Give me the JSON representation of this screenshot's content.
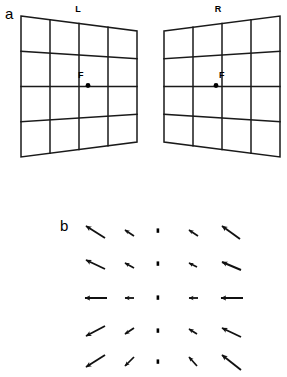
{
  "figure": {
    "panels": [
      {
        "id": "a",
        "letter": "a",
        "description": "Two perspective grid planes, one for each eye, with a fixation point F"
      },
      {
        "id": "b",
        "letter": "b",
        "description": "Vector field of retinal motion arrows arranged in a 5 by 5 array about a dotted vertical midline"
      }
    ],
    "stroke_color": "#1a1a1a",
    "background_color": "#ffffff"
  },
  "panel_a": {
    "letter": "a",
    "eyes": [
      {
        "id": "left",
        "label": "L",
        "label_name": "left-eye",
        "fixation_label": "F",
        "near_edge": "left",
        "rows": 4,
        "columns": 4,
        "outline": [
          [
            21,
            16
          ],
          [
            137,
            31
          ],
          [
            137,
            142
          ],
          [
            21,
            157
          ]
        ]
      },
      {
        "id": "right",
        "label": "R",
        "label_name": "right-eye",
        "fixation_label": "F",
        "near_edge": "right",
        "rows": 4,
        "columns": 4,
        "outline": [
          [
            164,
            31
          ],
          [
            280,
            16
          ],
          [
            280,
            157
          ],
          [
            164,
            142
          ]
        ]
      }
    ],
    "fixation": {
      "label": "F",
      "left_point": [
        88,
        85
      ],
      "right_point": [
        216,
        85
      ],
      "dot_radius": 2.4
    }
  },
  "panel_b": {
    "letter": "b",
    "midline": {
      "name": "dotted-midline",
      "x": 158,
      "y_top": 228,
      "y_bottom": 362,
      "dot_count": 5,
      "style": "dotted"
    },
    "vector_field": {
      "rows": 5,
      "columns": 5,
      "midline_column_index": 2,
      "column_x": [
        94,
        128,
        158,
        192,
        226
      ],
      "row_y": [
        231,
        264,
        298,
        331,
        362
      ],
      "arrows": [
        {
          "row": 0,
          "col": 0,
          "x": 94,
          "y": 231,
          "dx": -19,
          "dy": -12,
          "length": 22.5,
          "angle_deg": 212,
          "size": "long"
        },
        {
          "row": 0,
          "col": 1,
          "x": 128,
          "y": 231,
          "dx": -9,
          "dy": -6,
          "length": 10.8,
          "angle_deg": 214,
          "size": "short"
        },
        {
          "row": 0,
          "col": 3,
          "x": 192,
          "y": 231,
          "dx": -8,
          "dy": -6,
          "length": 10.0,
          "angle_deg": 217,
          "size": "short"
        },
        {
          "row": 0,
          "col": 4,
          "x": 226,
          "y": 231,
          "dx": -18,
          "dy": -13,
          "length": 22.2,
          "angle_deg": 216,
          "size": "long"
        },
        {
          "row": 1,
          "col": 0,
          "x": 94,
          "y": 264,
          "dx": -19,
          "dy": -9,
          "length": 21.0,
          "angle_deg": 205,
          "size": "long"
        },
        {
          "row": 1,
          "col": 1,
          "x": 128,
          "y": 264,
          "dx": -9,
          "dy": -5,
          "length": 10.3,
          "angle_deg": 209,
          "size": "short"
        },
        {
          "row": 1,
          "col": 3,
          "x": 192,
          "y": 264,
          "dx": -8,
          "dy": -4,
          "length": 8.9,
          "angle_deg": 207,
          "size": "short"
        },
        {
          "row": 1,
          "col": 4,
          "x": 226,
          "y": 264,
          "dx": -19,
          "dy": -8,
          "length": 20.6,
          "angle_deg": 203,
          "size": "long"
        },
        {
          "row": 2,
          "col": 0,
          "x": 94,
          "y": 298,
          "dx": -22,
          "dy": 0,
          "length": 22.0,
          "angle_deg": 180,
          "size": "long"
        },
        {
          "row": 2,
          "col": 1,
          "x": 128,
          "y": 298,
          "dx": -9,
          "dy": 0,
          "length": 9.0,
          "angle_deg": 180,
          "size": "short"
        },
        {
          "row": 2,
          "col": 3,
          "x": 192,
          "y": 298,
          "dx": -9,
          "dy": 0,
          "length": 9.0,
          "angle_deg": 180,
          "size": "short"
        },
        {
          "row": 2,
          "col": 4,
          "x": 226,
          "y": 298,
          "dx": -22,
          "dy": 0,
          "length": 22.0,
          "angle_deg": 180,
          "size": "long"
        },
        {
          "row": 3,
          "col": 0,
          "x": 94,
          "y": 331,
          "dx": -19,
          "dy": 9,
          "length": 21.0,
          "angle_deg": 155,
          "size": "long"
        },
        {
          "row": 3,
          "col": 1,
          "x": 128,
          "y": 331,
          "dx": -9,
          "dy": 5,
          "length": 10.3,
          "angle_deg": 151,
          "size": "short"
        },
        {
          "row": 3,
          "col": 3,
          "x": 192,
          "y": 331,
          "dx": -8,
          "dy": 4,
          "length": 8.9,
          "angle_deg": 153,
          "size": "short"
        },
        {
          "row": 3,
          "col": 4,
          "x": 226,
          "y": 331,
          "dx": -19,
          "dy": 8,
          "length": 20.6,
          "angle_deg": 157,
          "size": "long"
        },
        {
          "row": 4,
          "col": 0,
          "x": 94,
          "y": 362,
          "dx": -19,
          "dy": 12,
          "length": 22.5,
          "angle_deg": 148,
          "size": "long"
        },
        {
          "row": 4,
          "col": 1,
          "x": 128,
          "y": 362,
          "dx": -9,
          "dy": 6,
          "length": 10.8,
          "angle_deg": 146,
          "size": "short"
        },
        {
          "row": 4,
          "col": 3,
          "x": 192,
          "y": 362,
          "dx": -8,
          "dy": 6,
          "length": 10.0,
          "angle_deg": 143,
          "size": "short"
        },
        {
          "row": 4,
          "col": 4,
          "x": 226,
          "y": 362,
          "dx": -18,
          "dy": 13,
          "length": 22.2,
          "angle_deg": 144,
          "size": "long"
        }
      ]
    }
  }
}
